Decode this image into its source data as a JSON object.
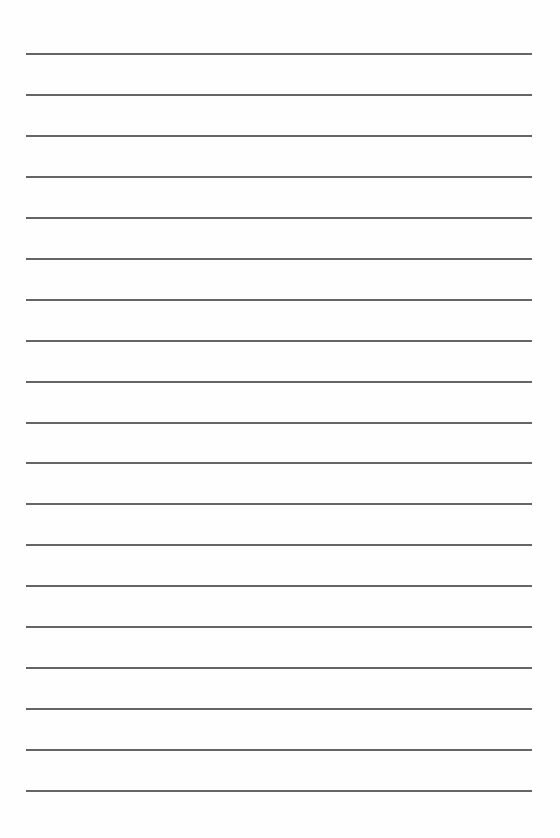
{
  "page": {
    "type": "lined-paper",
    "background": "#fefefe",
    "line_color": "#4a4a4a",
    "line_count": 19,
    "line_left": 26,
    "line_right": 532,
    "first_line_y": 54,
    "last_line_y": 791
  }
}
